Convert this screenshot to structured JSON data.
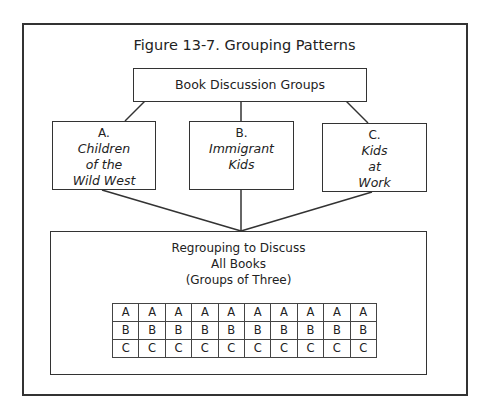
{
  "figure": {
    "title": "Figure 13-7. Grouping Patterns"
  },
  "root": {
    "label": "Book Discussion Groups"
  },
  "groups": [
    {
      "letter": "A.",
      "title": "Children\nof the\nWild West"
    },
    {
      "letter": "B.",
      "title": "Immigrant\nKids"
    },
    {
      "letter": "C.",
      "title": "Kids\nat\nWork"
    }
  ],
  "regroup": {
    "lines": [
      "Regrouping to Discuss",
      "All Books",
      "(Groups of Three)"
    ],
    "grid": {
      "rows": [
        [
          "A",
          "A",
          "A",
          "A",
          "A",
          "A",
          "A",
          "A",
          "A",
          "A"
        ],
        [
          "B",
          "B",
          "B",
          "B",
          "B",
          "B",
          "B",
          "B",
          "B",
          "B"
        ],
        [
          "C",
          "C",
          "C",
          "C",
          "C",
          "C",
          "C",
          "C",
          "C",
          "C"
        ]
      ]
    }
  },
  "colors": {
    "stroke": "#333333",
    "background": "#ffffff"
  }
}
